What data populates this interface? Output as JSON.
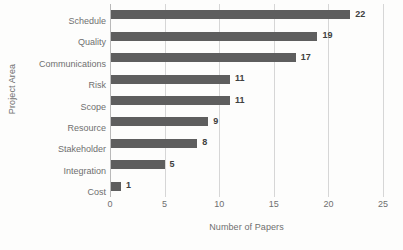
{
  "chart_data": {
    "type": "bar",
    "orientation": "horizontal",
    "title": "",
    "xlabel": "Number of Papers",
    "ylabel": "Project Area",
    "categories": [
      "Schedule",
      "Quality",
      "Communications",
      "Risk",
      "Scope",
      "Resource",
      "Stakeholder",
      "Integration",
      "Cost"
    ],
    "values": [
      22,
      19,
      17,
      11,
      11,
      9,
      8,
      5,
      1
    ],
    "value_labels": [
      "22",
      "19",
      "17",
      "11",
      "11",
      "9",
      "8",
      "5",
      "1"
    ],
    "xlim": [
      0,
      25
    ],
    "xticks": [
      0,
      5,
      10,
      15,
      20,
      25
    ],
    "xtick_labels": [
      "0",
      "5",
      "10",
      "15",
      "20",
      "25"
    ],
    "grid": "vertical",
    "legend": "none",
    "bar_color": "#5e5e5e",
    "gridline_color": "#d6d6d6",
    "axis_color": "#b9b9b9",
    "text_color": "#6f6f6f",
    "value_label_color": "#404040",
    "background_color": "#fdfdfc"
  }
}
